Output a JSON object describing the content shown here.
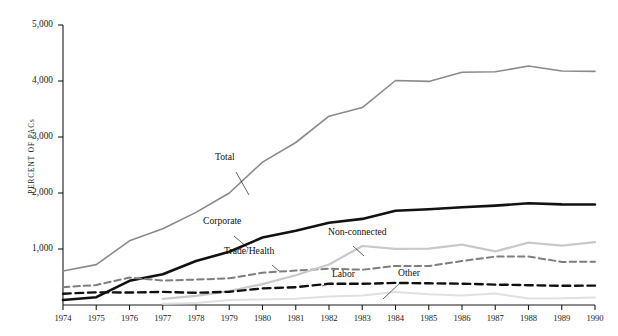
{
  "chart_data": {
    "type": "line",
    "title": "",
    "subtitle": "",
    "xlabel": "",
    "ylabel": "PERCENT OF PACs",
    "x": [
      1974,
      1975,
      1976,
      1977,
      1978,
      1979,
      1980,
      1981,
      1982,
      1983,
      1984,
      1985,
      1986,
      1987,
      1988,
      1989,
      1990
    ],
    "xtick_labels": [
      "1974",
      "1975",
      "1976",
      "1977",
      "1978",
      "1979",
      "1980",
      "1981",
      "1982",
      "1983",
      "1984",
      "1985",
      "1986",
      "1987",
      "1988",
      "1989",
      "1990"
    ],
    "ytick_labels": [
      "1,000",
      "2,000",
      "3,000",
      "4,000",
      "5,000"
    ],
    "ytick_values": [
      1000,
      2000,
      3000,
      4000,
      5000
    ],
    "ylim": [
      0,
      5000
    ],
    "xlim": [
      1974,
      1990
    ],
    "grid": false,
    "legend_position": "inline-annotations",
    "series": [
      {
        "name": "Total",
        "style": "solid",
        "color": "#8a8a8a",
        "width": 1.6,
        "values": [
          608,
          722,
          1146,
          1360,
          1653,
          2000,
          2551,
          2901,
          3371,
          3525,
          4009,
          3992,
          4157,
          4165,
          4268,
          4178,
          4172
        ]
      },
      {
        "name": "Corporate",
        "style": "solid",
        "color": "#121212",
        "width": 2.6,
        "values": [
          89,
          139,
          433,
          550,
          785,
          950,
          1206,
          1327,
          1469,
          1538,
          1682,
          1710,
          1744,
          1775,
          1816,
          1796,
          1795
        ]
      },
      {
        "name": "Trade/Health",
        "style": "dashed",
        "color": "#7e7e7e",
        "width": 2.0,
        "values": [
          318,
          357,
          489,
          438,
          453,
          477,
          576,
          614,
          649,
          630,
          698,
          695,
          786,
          865,
          865,
          770,
          774
        ]
      },
      {
        "name": "Non-connected",
        "style": "solid",
        "color": "#c9c9c9",
        "width": 2.2,
        "values": [
          0,
          0,
          0,
          110,
          162,
          248,
          374,
          531,
          723,
          1053,
          1002,
          1008,
          1077,
          957,
          1115,
          1060,
          1121
        ]
      },
      {
        "name": "Labor",
        "style": "dashed",
        "color": "#101010",
        "width": 2.4,
        "values": [
          201,
          226,
          224,
          234,
          217,
          235,
          297,
          318,
          380,
          378,
          394,
          388,
          380,
          364,
          354,
          342,
          346
        ]
      },
      {
        "name": "Other",
        "style": "solid",
        "color": "#e0e0e0",
        "width": 2.0,
        "values": [
          0,
          0,
          0,
          24,
          36,
          90,
          98,
          111,
          150,
          171,
          233,
          191,
          170,
          204,
          118,
          120,
          136
        ]
      }
    ],
    "annotations": [
      {
        "text": "Total",
        "x": 215,
        "y": 161,
        "leader": [
          [
            236,
            172
          ],
          [
            249,
            195
          ]
        ]
      },
      {
        "text": "Corporate",
        "x": 203,
        "y": 225,
        "leader": [
          [
            234,
            236
          ],
          [
            248,
            248
          ]
        ]
      },
      {
        "text": "Trade/Health",
        "x": 224,
        "y": 255,
        "leader": [
          [
            272,
            265
          ],
          [
            279,
            271
          ]
        ]
      },
      {
        "text": "Non-connected",
        "x": 328,
        "y": 236,
        "leader": [
          [
            353,
            246
          ],
          [
            364,
            256
          ]
        ]
      },
      {
        "text": "Labor",
        "x": 332,
        "y": 278,
        "leader": [
          [
            332,
            283
          ],
          [
            322,
            286
          ]
        ]
      },
      {
        "text": "Other",
        "x": 398,
        "y": 277,
        "leader": [
          [
            400,
            283
          ],
          [
            383,
            299
          ]
        ]
      }
    ]
  }
}
